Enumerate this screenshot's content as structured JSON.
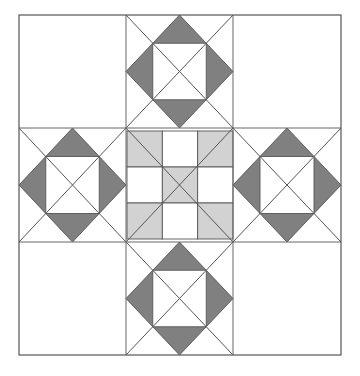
{
  "figure": {
    "kind": "quilt-block",
    "canvas": {
      "width": 360,
      "height": 376,
      "background": "#ffffff"
    }
  },
  "palette": {
    "background": "#ffffff",
    "patch_light": "#ffffff",
    "patch_gray": "#d2d2d2",
    "patch_dark": "#808080",
    "outline": "#555555",
    "grid_line": "#666666",
    "diagonal_line": "#555555"
  },
  "block": {
    "label": "nine-patch-star-block",
    "outline": {
      "x": 19,
      "y": 15,
      "width": 322,
      "height": 340
    },
    "grid": {
      "columns": 3,
      "rows": 3,
      "x_lines": [
        19,
        126,
        233,
        341
      ],
      "y_lines": [
        15,
        128,
        242,
        355
      ]
    },
    "cells": [
      {
        "row": 0,
        "col": 0,
        "name": "corner-top-left",
        "type": "plain",
        "fill": "#ffffff"
      },
      {
        "row": 0,
        "col": 1,
        "name": "star-top",
        "type": "square-in-square",
        "diamond_fill": "#808080",
        "inner_fill": "#ffffff"
      },
      {
        "row": 0,
        "col": 2,
        "name": "corner-top-right",
        "type": "plain",
        "fill": "#ffffff"
      },
      {
        "row": 1,
        "col": 0,
        "name": "star-left",
        "type": "square-in-square",
        "diamond_fill": "#808080",
        "inner_fill": "#ffffff"
      },
      {
        "row": 1,
        "col": 1,
        "name": "center-nine-patch",
        "type": "nine-patch"
      },
      {
        "row": 1,
        "col": 2,
        "name": "star-right",
        "type": "square-in-square",
        "diamond_fill": "#808080",
        "inner_fill": "#ffffff"
      },
      {
        "row": 2,
        "col": 0,
        "name": "corner-bottom-left",
        "type": "plain",
        "fill": "#ffffff"
      },
      {
        "row": 2,
        "col": 1,
        "name": "star-bottom",
        "type": "square-in-square",
        "diamond_fill": "#808080",
        "inner_fill": "#ffffff"
      },
      {
        "row": 2,
        "col": 2,
        "name": "corner-bottom-right",
        "type": "plain",
        "fill": "#ffffff"
      }
    ],
    "nine_patch": {
      "x": 127,
      "y": 131,
      "width": 106,
      "height": 108,
      "fill_map": [
        [
          "#d2d2d2",
          "#ffffff",
          "#d2d2d2"
        ],
        [
          "#ffffff",
          "#d2d2d2",
          "#ffffff"
        ],
        [
          "#d2d2d2",
          "#ffffff",
          "#d2d2d2"
        ]
      ]
    },
    "line_widths": {
      "outline": 1.2,
      "grid": 1.0,
      "diagonal": 1.0,
      "patch": 0.9
    }
  },
  "chart_data": {
    "type": "diagram",
    "grid": {
      "rows": 3,
      "columns": 3
    },
    "patch_counts": {
      "plain_white_corner_squares": 4,
      "square_in_square_units": 4,
      "nine_patch_center": 1,
      "nine_patch_gray_squares": 5,
      "nine_patch_white_squares": 4
    },
    "colors_used": [
      "#ffffff",
      "#d2d2d2",
      "#808080"
    ]
  }
}
